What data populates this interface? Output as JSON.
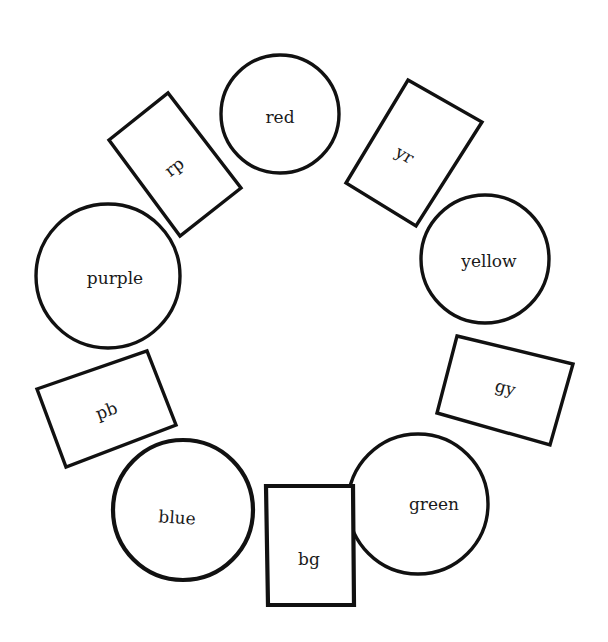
{
  "diagram": {
    "title": "",
    "type": "color-wheel",
    "background": "#ffffff",
    "stroke_color": "#111111",
    "primary_colors": [
      {
        "id": "red",
        "label": "red",
        "shape": "circle",
        "cx": 280,
        "cy": 114,
        "r": 59
      },
      {
        "id": "yellow",
        "label": "yellow",
        "shape": "circle",
        "cx": 485,
        "cy": 259,
        "r": 64
      },
      {
        "id": "green",
        "label": "green",
        "shape": "circle",
        "cx": 418,
        "cy": 504,
        "r": 70
      },
      {
        "id": "blue",
        "label": "blue",
        "shape": "circle",
        "cx": 183,
        "cy": 510,
        "r": 70
      },
      {
        "id": "purple",
        "label": "purple",
        "shape": "circle",
        "cx": 108,
        "cy": 276,
        "r": 72
      }
    ],
    "intermediate_colors": [
      {
        "id": "yr",
        "label": "yr",
        "shape": "rect",
        "points": "408,80 482,122 416,226 346,183",
        "lx": 405,
        "ly": 155,
        "rot": 30
      },
      {
        "id": "gy",
        "label": "gy",
        "shape": "rect",
        "points": "457,336 573,364 550,445 437,413",
        "lx": 505,
        "ly": 390,
        "rot": 15
      },
      {
        "id": "bg",
        "label": "bg",
        "shape": "rect",
        "points": "266,486 353,486 354,605 268,605",
        "lx": 310,
        "ly": 560,
        "rot": 0
      },
      {
        "id": "pb",
        "label": "pb",
        "shape": "rect",
        "points": "37,389 147,351 176,425 66,467",
        "lx": 107,
        "ly": 411,
        "rot": -20
      },
      {
        "id": "rp",
        "label": "rp",
        "shape": "rect",
        "points": "109,140 168,93 241,188 180,236",
        "lx": 175,
        "ly": 167,
        "rot": -38
      }
    ],
    "order_clockwise": [
      "red",
      "yr",
      "yellow",
      "gy",
      "green",
      "bg",
      "blue",
      "pb",
      "purple",
      "rp"
    ]
  }
}
